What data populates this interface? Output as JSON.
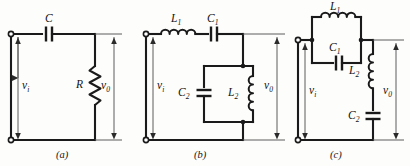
{
  "figure": {
    "type": "circuit-schematic-set",
    "background_color": "#fdfdfc",
    "line_color": "#1a1a1a"
  },
  "circuits": [
    {
      "id": "a",
      "caption": "(a)",
      "input_label": "v",
      "input_sub": "i",
      "output_label": "v",
      "output_sub": "0",
      "components": [
        {
          "name": "C",
          "sub": "",
          "type": "capacitor",
          "orientation": "horizontal",
          "position": "series-top"
        },
        {
          "name": "R",
          "sub": "",
          "type": "resistor",
          "orientation": "vertical",
          "position": "shunt-right"
        }
      ]
    },
    {
      "id": "b",
      "caption": "(b)",
      "input_label": "v",
      "input_sub": "i",
      "output_label": "v",
      "output_sub": "0",
      "components": [
        {
          "name": "L",
          "sub": "1",
          "type": "inductor",
          "orientation": "horizontal",
          "position": "series-top-left"
        },
        {
          "name": "C",
          "sub": "1",
          "type": "capacitor",
          "orientation": "horizontal",
          "position": "series-top-right"
        },
        {
          "name": "C",
          "sub": "2",
          "type": "capacitor",
          "orientation": "vertical",
          "position": "tank-left"
        },
        {
          "name": "L",
          "sub": "2",
          "type": "inductor",
          "orientation": "vertical",
          "position": "tank-right"
        }
      ]
    },
    {
      "id": "c",
      "caption": "(c)",
      "input_label": "v",
      "input_sub": "i",
      "output_label": "v",
      "output_sub": "0",
      "components": [
        {
          "name": "L",
          "sub": "1",
          "type": "inductor",
          "orientation": "horizontal",
          "position": "tank-top"
        },
        {
          "name": "C",
          "sub": "1",
          "type": "capacitor",
          "orientation": "horizontal",
          "position": "tank-bottom"
        },
        {
          "name": "L",
          "sub": "2",
          "type": "inductor",
          "orientation": "vertical",
          "position": "shunt-upper"
        },
        {
          "name": "C",
          "sub": "2",
          "type": "capacitor",
          "orientation": "vertical",
          "position": "shunt-lower"
        }
      ]
    }
  ],
  "labels": {
    "a_C": "C",
    "a_R": "R",
    "a_vi": "v",
    "a_vi_sub": "i",
    "a_vo": "v",
    "a_vo_sub": "0",
    "a_caption": "(a)",
    "b_L1": "L",
    "b_L1_sub": "1",
    "b_C1": "C",
    "b_C1_sub": "1",
    "b_C2": "C",
    "b_C2_sub": "2",
    "b_L2": "L",
    "b_L2_sub": "2",
    "b_vi": "v",
    "b_vi_sub": "i",
    "b_vo": "v",
    "b_vo_sub": "0",
    "b_caption": "(b)",
    "c_L1": "L",
    "c_L1_sub": "1",
    "c_C1": "C",
    "c_C1_sub": "1",
    "c_L2": "L",
    "c_L2_sub": "2",
    "c_C2": "C",
    "c_C2_sub": "2",
    "c_vi": "v",
    "c_vi_sub": "i",
    "c_vo": "v",
    "c_vo_sub": "0",
    "c_caption": "(c)"
  }
}
